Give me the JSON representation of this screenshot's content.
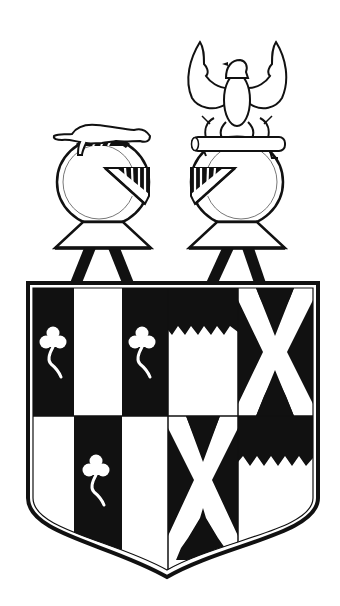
{
  "image": {
    "subject": "heraldic coat of arms",
    "width": 340,
    "height": 606,
    "background": "#ffffff",
    "ink": "#111111"
  },
  "crests": [
    {
      "position": "left",
      "figure": "weasel passant",
      "helm": "barred helm facing right"
    },
    {
      "position": "right",
      "figure": "eagle displayed on a log",
      "helm": "barred helm facing left"
    }
  ],
  "shield": {
    "quarters": [
      {
        "position": "upper-left",
        "charge": "paly with trefoils slipped"
      },
      {
        "position": "upper-right",
        "charge": "saltire engrailed"
      },
      {
        "position": "lower-left",
        "charge": "paly with trefoil slipped"
      },
      {
        "position": "lower-right",
        "charge": "saltire engrailed"
      },
      {
        "position": "upper-middle",
        "charge": "chief dancetty"
      },
      {
        "position": "lower-far-right",
        "charge": "chief dancetty"
      }
    ]
  }
}
